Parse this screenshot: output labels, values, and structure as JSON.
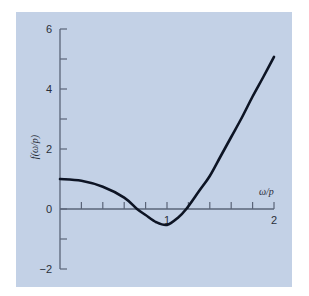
{
  "chart_data": {
    "type": "line",
    "title": "",
    "xlabel": "ω/p",
    "ylabel": "f(ω/p)",
    "xlim": [
      0,
      2
    ],
    "ylim": [
      -2,
      6
    ],
    "grid": false,
    "legend": null,
    "x_ticks": [
      0,
      0.2,
      0.4,
      0.6,
      0.8,
      1.0,
      1.2,
      1.4,
      1.6,
      1.8,
      2.0
    ],
    "x_tick_labels": [
      {
        "value": 1,
        "label": "1"
      },
      {
        "value": 2,
        "label": "2"
      }
    ],
    "y_ticks": [
      -2,
      -1,
      0,
      1,
      2,
      3,
      4,
      5,
      6
    ],
    "y_tick_labels": [
      {
        "value": 6,
        "label": "6"
      },
      {
        "value": 4,
        "label": "4"
      },
      {
        "value": 2,
        "label": "2"
      },
      {
        "value": 0,
        "label": "0"
      },
      {
        "value": -2,
        "label": "-2"
      }
    ],
    "series": [
      {
        "name": "f(ω/p)",
        "x": [
          0,
          0.2,
          0.4,
          0.6,
          0.72,
          0.8,
          0.9,
          1.0,
          1.1,
          1.18,
          1.3,
          1.4,
          1.5,
          1.6,
          1.7,
          1.8,
          1.9,
          2.0
        ],
        "y": [
          1.0,
          0.94,
          0.74,
          0.38,
          0.0,
          -0.2,
          -0.44,
          -0.53,
          -0.3,
          0.0,
          0.6,
          1.1,
          1.75,
          2.4,
          3.05,
          3.75,
          4.4,
          5.07
        ]
      }
    ]
  },
  "colors": {
    "panel": "#c3d1e6",
    "axis": "#5a6478",
    "curve": "#0d1424"
  }
}
